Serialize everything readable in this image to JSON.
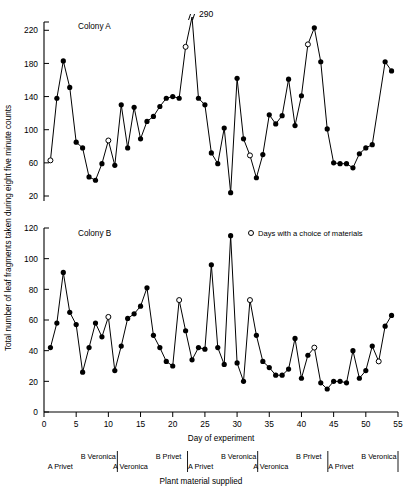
{
  "figure": {
    "y_axis_label": "Total number of leaf fragments taken during eight five minute counts",
    "x_axis_label": "Day of experiment",
    "material_axis_label": "Plant material supplied",
    "legend": {
      "marker": "open-circle",
      "text": "Days with a choice of materials"
    },
    "offscale_annotation": "290"
  },
  "panels": [
    {
      "id": "A",
      "title": "Colony A"
    },
    {
      "id": "B",
      "title": "Colony B"
    }
  ],
  "material_segments": [
    {
      "upper": "B Veronica",
      "lower": "A Privet"
    },
    {
      "upper": "B Privet",
      "lower": "A Veronica"
    },
    {
      "upper": "B Veronica",
      "lower": "A Privet"
    },
    {
      "upper": "B Privet",
      "lower": "A Veronica"
    },
    {
      "upper": "B Veronica",
      "lower": "A Privet"
    }
  ],
  "chart_data": [
    {
      "type": "line",
      "title": "Colony A",
      "xlabel": "Day of experiment",
      "ylabel": "Total number of leaf fragments taken during eight five minute counts",
      "xlim": [
        0,
        55
      ],
      "ylim": [
        20,
        230
      ],
      "xticks": [
        0,
        5,
        10,
        15,
        20,
        25,
        30,
        35,
        40,
        45,
        50,
        55
      ],
      "yticks": [
        20,
        60,
        100,
        140,
        180,
        220
      ],
      "grid": false,
      "legend_position": "top-right",
      "x": [
        1,
        2,
        3,
        4,
        5,
        6,
        7,
        8,
        9,
        10,
        11,
        12,
        13,
        14,
        15,
        16,
        17,
        18,
        19,
        20,
        21,
        22,
        23,
        24,
        25,
        26,
        27,
        28,
        29,
        30,
        31,
        32,
        33,
        34,
        35,
        36,
        37,
        38,
        39,
        40,
        41,
        42,
        43,
        44,
        45,
        46,
        47,
        48,
        49,
        50,
        51,
        52,
        53,
        54,
        55
      ],
      "values": [
        63,
        138,
        183,
        151,
        85,
        78,
        43,
        39,
        59,
        87,
        57,
        130,
        78,
        127,
        89,
        110,
        116,
        128,
        138,
        140,
        138,
        200,
        290,
        138,
        130,
        72,
        59,
        102,
        24,
        162,
        89,
        69,
        42,
        70,
        118,
        107,
        117,
        161,
        105,
        141,
        203,
        223,
        182,
        101,
        60,
        59,
        59,
        54,
        71,
        78,
        82,
        null,
        182,
        171,
        null
      ],
      "open_markers": [
        {
          "day": 1,
          "value": 63
        },
        {
          "day": 10,
          "value": 87
        },
        {
          "day": 22,
          "value": 200
        },
        {
          "day": 32,
          "value": 82
        },
        {
          "day": 41,
          "value": 203
        },
        {
          "day": 52,
          "value": 82
        }
      ],
      "offscale_points": [
        {
          "day": 23,
          "value": 290,
          "label": "290"
        }
      ]
    },
    {
      "type": "line",
      "title": "Colony B",
      "xlabel": "Day of experiment",
      "ylabel": "Total number of leaf fragments taken during eight five minute counts",
      "xlim": [
        0,
        55
      ],
      "ylim": [
        0,
        120
      ],
      "xticks": [
        0,
        5,
        10,
        15,
        20,
        25,
        30,
        35,
        40,
        45,
        50,
        55
      ],
      "yticks": [
        0,
        20,
        40,
        60,
        80,
        100,
        120
      ],
      "grid": false,
      "legend_position": "top-right",
      "x": [
        1,
        2,
        3,
        4,
        5,
        6,
        7,
        8,
        9,
        10,
        11,
        12,
        13,
        14,
        15,
        16,
        17,
        18,
        19,
        20,
        21,
        22,
        23,
        24,
        25,
        26,
        27,
        28,
        29,
        30,
        31,
        32,
        33,
        34,
        35,
        36,
        37,
        38,
        39,
        40,
        41,
        42,
        43,
        44,
        45,
        46,
        47,
        48,
        49,
        50,
        51,
        52,
        53,
        54
      ],
      "values": [
        42,
        58,
        91,
        65,
        57,
        26,
        42,
        58,
        49,
        62,
        27,
        43,
        61,
        64,
        69,
        81,
        50,
        42,
        33,
        30,
        73,
        53,
        34,
        42,
        41,
        96,
        42,
        31,
        115,
        32,
        20,
        73,
        50,
        33,
        29,
        24,
        24,
        28,
        48,
        22,
        37,
        42,
        19,
        15,
        20,
        20,
        19,
        40,
        22,
        27,
        43,
        33,
        56,
        63
      ],
      "open_markers": [
        {
          "day": 10,
          "value": 62
        },
        {
          "day": 21,
          "value": 73
        },
        {
          "day": 32,
          "value": 73
        },
        {
          "day": 42,
          "value": 42
        },
        {
          "day": 52,
          "value": 33
        }
      ]
    }
  ]
}
